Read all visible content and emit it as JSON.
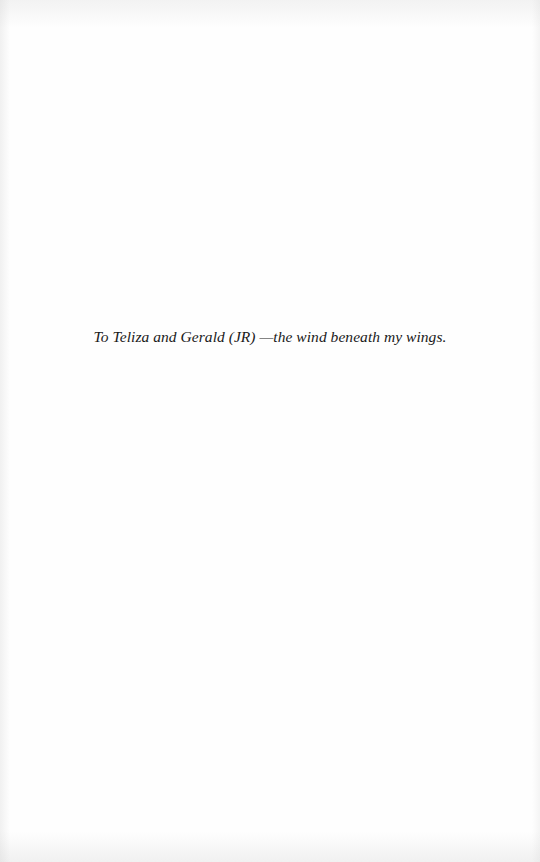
{
  "page": {
    "type": "dedication",
    "background_color": "#fefefe",
    "text_color": "#1a1a1a"
  },
  "dedication": {
    "text": "To Teliza and Gerald (JR) —the wind beneath my wings."
  }
}
